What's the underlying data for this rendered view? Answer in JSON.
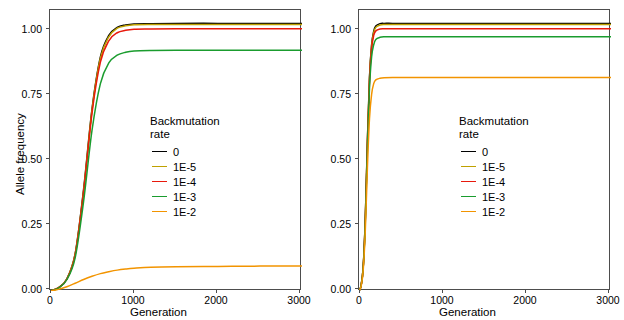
{
  "figure": {
    "background": "#ffffff",
    "panel_count": 2
  },
  "legend": {
    "title_line1": "Backmutation",
    "title_line2": "rate",
    "entries": [
      {
        "label": "0",
        "color": "#000000"
      },
      {
        "label": "1E-5",
        "color": "#bfa100"
      },
      {
        "label": "1E-4",
        "color": "#e8190c"
      },
      {
        "label": "1E-3",
        "color": "#1a9c2e"
      },
      {
        "label": "1E-2",
        "color": "#f29400"
      }
    ]
  },
  "chart_data": [
    {
      "type": "line",
      "panel": "left",
      "title": "",
      "xlabel": "Generation",
      "ylabel": "Allele frequency",
      "xlim": [
        0,
        3000
      ],
      "ylim": [
        0.0,
        1.05
      ],
      "xticks": [
        0,
        1000,
        2000,
        3000
      ],
      "xtick_labels": [
        "0",
        "1000",
        "2000",
        "3000"
      ],
      "yticks": [
        0.0,
        0.25,
        0.5,
        0.75,
        1.0
      ],
      "ytick_labels": [
        "0.00",
        "0.25",
        "0.50",
        "0.75",
        "1.00"
      ],
      "grid": false,
      "legend_position": "inside-center-right",
      "x": [
        0,
        100,
        200,
        300,
        400,
        500,
        600,
        700,
        800,
        900,
        1000,
        1200,
        1500,
        2000,
        2500,
        3000
      ],
      "series": [
        {
          "name": "0",
          "color": "#000000",
          "values": [
            0.0,
            0.012,
            0.045,
            0.14,
            0.38,
            0.68,
            0.875,
            0.955,
            0.985,
            0.994,
            0.998,
            0.999,
            1.0,
            1.0,
            1.0,
            1.0
          ]
        },
        {
          "name": "1E-5",
          "color": "#bfa100",
          "values": [
            0.0,
            0.012,
            0.045,
            0.14,
            0.375,
            0.675,
            0.87,
            0.95,
            0.982,
            0.991,
            0.995,
            0.996,
            0.996,
            0.996,
            0.996,
            0.996
          ]
        },
        {
          "name": "1E-4",
          "color": "#e8190c",
          "values": [
            0.0,
            0.012,
            0.044,
            0.135,
            0.37,
            0.665,
            0.855,
            0.935,
            0.965,
            0.974,
            0.978,
            0.979,
            0.98,
            0.98,
            0.98,
            0.98
          ]
        },
        {
          "name": "1E-3",
          "color": "#1a9c2e",
          "values": [
            0.0,
            0.011,
            0.042,
            0.125,
            0.335,
            0.6,
            0.775,
            0.852,
            0.881,
            0.892,
            0.897,
            0.899,
            0.9,
            0.9,
            0.9,
            0.9
          ]
        },
        {
          "name": "1E-2",
          "color": "#f29400",
          "values": [
            0.0,
            0.006,
            0.016,
            0.029,
            0.043,
            0.055,
            0.065,
            0.072,
            0.078,
            0.082,
            0.085,
            0.089,
            0.091,
            0.092,
            0.093,
            0.093
          ]
        }
      ]
    },
    {
      "type": "line",
      "panel": "right",
      "title": "",
      "xlabel": "Generation",
      "ylabel": "",
      "xlim": [
        0,
        3000
      ],
      "ylim": [
        0.0,
        1.05
      ],
      "xticks": [
        0,
        1000,
        2000,
        3000
      ],
      "xtick_labels": [
        "0",
        "1000",
        "2000",
        "3000"
      ],
      "yticks": [
        0.0,
        0.25,
        0.5,
        0.75,
        1.0
      ],
      "ytick_labels": [
        "0.00",
        "0.25",
        "0.50",
        "0.75",
        "1.00"
      ],
      "grid": false,
      "legend_position": "inside-center-right",
      "x": [
        0,
        25,
        50,
        75,
        100,
        125,
        150,
        175,
        200,
        250,
        300,
        400,
        600,
        1000,
        2000,
        3000
      ],
      "series": [
        {
          "name": "0",
          "color": "#000000",
          "values": [
            0.0,
            0.02,
            0.09,
            0.27,
            0.56,
            0.8,
            0.92,
            0.97,
            0.99,
            0.999,
            1.0,
            1.0,
            1.0,
            1.0,
            1.0,
            1.0
          ]
        },
        {
          "name": "1E-5",
          "color": "#bfa100",
          "values": [
            0.0,
            0.02,
            0.09,
            0.27,
            0.555,
            0.795,
            0.915,
            0.965,
            0.985,
            0.994,
            0.996,
            0.996,
            0.996,
            0.996,
            0.996,
            0.996
          ]
        },
        {
          "name": "1E-4",
          "color": "#e8190c",
          "values": [
            0.0,
            0.02,
            0.088,
            0.265,
            0.55,
            0.785,
            0.905,
            0.955,
            0.972,
            0.979,
            0.98,
            0.98,
            0.98,
            0.98,
            0.98,
            0.98
          ]
        },
        {
          "name": "1E-3",
          "color": "#1a9c2e",
          "values": [
            0.0,
            0.02,
            0.086,
            0.255,
            0.53,
            0.76,
            0.875,
            0.92,
            0.94,
            0.948,
            0.95,
            0.95,
            0.95,
            0.95,
            0.95,
            0.95
          ]
        },
        {
          "name": "1E-2",
          "color": "#f29400",
          "values": [
            0.0,
            0.018,
            0.078,
            0.225,
            0.46,
            0.645,
            0.735,
            0.775,
            0.789,
            0.795,
            0.797,
            0.798,
            0.798,
            0.798,
            0.798,
            0.798
          ]
        }
      ]
    }
  ]
}
